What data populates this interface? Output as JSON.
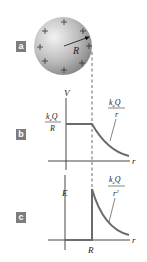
{
  "panels": {
    "a": {
      "label": "a",
      "radius_label": "R"
    },
    "b": {
      "label": "b",
      "y_axis_label": "V",
      "x_axis_label": "r",
      "inside_value": {
        "num": "k",
        "sub": "e",
        "num_tail": "Q",
        "den": "R"
      },
      "outside_value": {
        "num": "k",
        "sub": "e",
        "num_tail": "Q",
        "den": "r"
      }
    },
    "c": {
      "label": "c",
      "y_axis_label": "E",
      "x_axis_label": "r",
      "x_tick_label": "R",
      "outside_value": {
        "num": "k",
        "sub": "e",
        "num_tail": "Q",
        "den": "r",
        "den_sup": "2"
      }
    }
  },
  "colors": {
    "curve": "#6b6b6b",
    "axis": "#333333",
    "label_box": "#7d7d7d",
    "sphere_light": "#e6e6e6",
    "sphere_dark": "#8a8a8a"
  }
}
